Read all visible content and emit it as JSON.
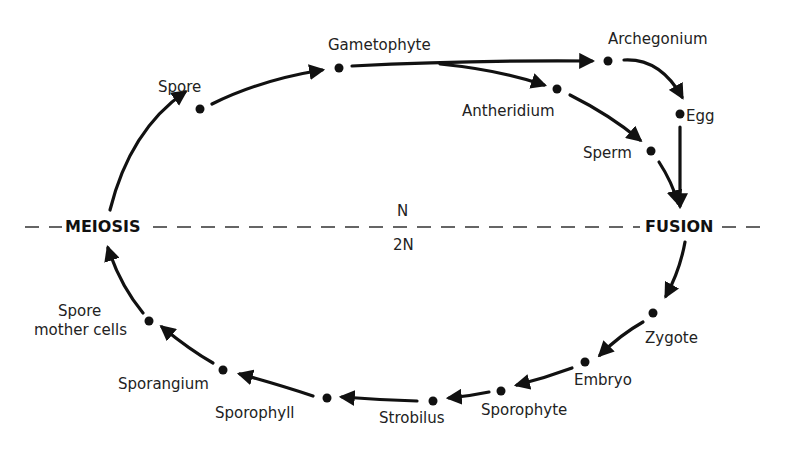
{
  "diagram": {
    "type": "life-cycle",
    "divider": {
      "upper_label": "N",
      "lower_label": "2N"
    },
    "events": {
      "left": "MEIOSIS",
      "right": "FUSION"
    },
    "nodes": {
      "spore": "Spore",
      "gametophyte": "Gametophyte",
      "archegonium": "Archegonium",
      "antheridium": "Antheridium",
      "egg": "Egg",
      "sperm": "Sperm",
      "zygote": "Zygote",
      "embryo": "Embryo",
      "sporophyte": "Sporophyte",
      "strobilus": "Strobilus",
      "sporophyll": "Sporophyll",
      "sporangium": "Sporangium",
      "spore_mother_cells_line1": "Spore",
      "spore_mother_cells_line2": "mother cells"
    },
    "flow": [
      "MEIOSIS",
      "Spore",
      "Gametophyte",
      "Archegonium",
      "Antheridium",
      "Egg",
      "Sperm",
      "FUSION",
      "Zygote",
      "Embryo",
      "Sporophyte",
      "Strobilus",
      "Sporophyll",
      "Sporangium",
      "Spore mother cells",
      "MEIOSIS"
    ]
  }
}
